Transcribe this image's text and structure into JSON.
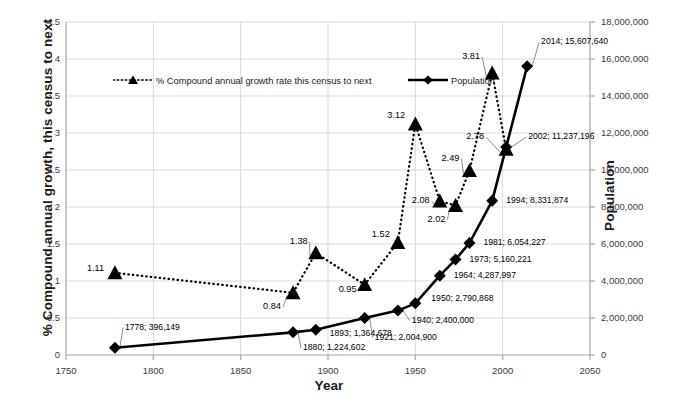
{
  "chart_data": {
    "type": "line",
    "title": "",
    "xlabel": "Year",
    "ylabel": "% Compound annual growth, this census to next",
    "y2label": "Population",
    "xlim": [
      1750,
      2050
    ],
    "xticks": [
      "1750",
      "1800",
      "1850",
      "1900",
      "1950",
      "2000",
      "2050"
    ],
    "ylim": [
      0,
      4.5
    ],
    "yticks": [
      "0",
      "0.5",
      "1",
      "1.5",
      "2",
      "2.5",
      "3",
      "3.5",
      "4",
      "4.5"
    ],
    "y2lim": [
      0,
      18000000
    ],
    "y2ticks": [
      "0",
      "2,000,000",
      "4,000,000",
      "6,000,000",
      "8,000,000",
      "10,000,000",
      "12,000,000",
      "14,000,000",
      "16,000,000",
      "18,000,000"
    ],
    "grid": true,
    "legend_position": "inside-top-left",
    "series": [
      {
        "name": "% Compound annual growth rate this census to next",
        "axis": "left",
        "style": "dotted",
        "marker": "triangle",
        "color": "#000000",
        "x": [
          1778,
          1880,
          1893,
          1921,
          1940,
          1950,
          1964,
          1973,
          1981,
          1994,
          2002
        ],
        "values": [
          1.11,
          0.84,
          1.38,
          0.95,
          1.52,
          3.12,
          2.08,
          2.02,
          2.49,
          3.81,
          2.78
        ],
        "labels": [
          "1.11",
          "0.84",
          "1.38",
          "0.95",
          "1.52",
          "3.12",
          "2.08",
          "2.02",
          "2.49",
          "3.81",
          "2.78"
        ]
      },
      {
        "name": "Population",
        "axis": "right",
        "style": "solid",
        "marker": "diamond",
        "color": "#000000",
        "x": [
          1778,
          1880,
          1893,
          1921,
          1940,
          1950,
          1964,
          1973,
          1981,
          1994,
          2002,
          2014
        ],
        "values": [
          396149,
          1224602,
          1364678,
          2004900,
          2400000,
          2790868,
          4287997,
          5160221,
          6054227,
          8331874,
          11237196,
          15607640
        ],
        "labels": [
          "1778; 396,149",
          "1880; 1,224,602",
          "1893; 1,364,678",
          "1921; 2,004,900",
          "1940; 2,400,000",
          "1950; 2,790,868",
          "1964; 4,287,997",
          "1973; 5,160,221",
          "1981; 6,054,227",
          "1994; 8,331,874",
          "2002; 11,237,196",
          "2014; 15,607,640"
        ]
      }
    ]
  },
  "legend": {
    "growth_label": "% Compound annual growth rate this census to next",
    "population_label": "Population"
  },
  "axes": {
    "x_title": "Year",
    "y_left_title": "% Compound annual growth, this census to next",
    "y_right_title": "Population"
  }
}
